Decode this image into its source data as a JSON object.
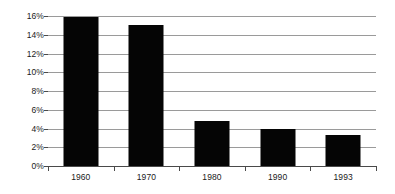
{
  "chart_data": {
    "type": "bar",
    "title": "",
    "subtitle": "",
    "xlabel": "",
    "ylabel": "",
    "categories": [
      "1960",
      "1970",
      "1980",
      "1990",
      "1993"
    ],
    "values": [
      15.9,
      15.0,
      4.8,
      4.0,
      3.3
    ],
    "value_labels": [
      "",
      "",
      "",
      "",
      ""
    ],
    "ylim": [
      0,
      16
    ],
    "y_ticks": [
      0,
      2,
      4,
      6,
      8,
      10,
      12,
      14,
      16
    ],
    "y_tick_labels": [
      "0%",
      "2%",
      "4%",
      "6%",
      "8%",
      "10%",
      "12%",
      "14%",
      "16%"
    ],
    "grid": true,
    "grid_axis": "y",
    "legend": false,
    "legend_position": "none",
    "series": [
      {
        "name": "",
        "values": [
          15.9,
          15.0,
          4.8,
          4.0,
          3.3
        ]
      }
    ]
  },
  "style": {
    "bar_color": "#050505",
    "gridline_color": "#9a9a9a",
    "axis_color": "#4a4a4a",
    "text_color": "#1a1a1a",
    "background_color": "#ffffff"
  }
}
